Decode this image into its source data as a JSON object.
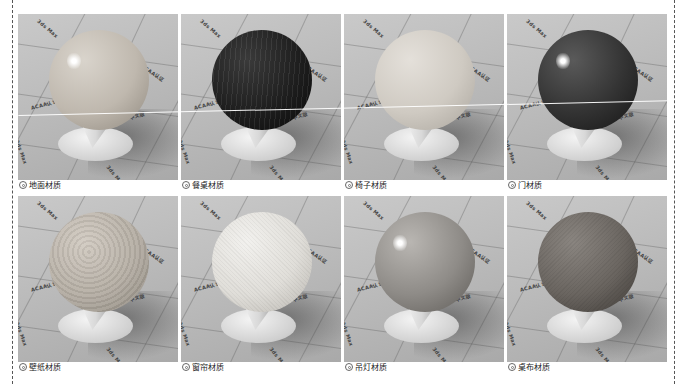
{
  "page": {
    "layout": "2 rows x 4 columns material preview grid",
    "rows": [
      {
        "items": [
          {
            "label": "地面材质",
            "bullet_icon": "circled-dot-icon",
            "sphere": {
              "base": "#d9d4cc",
              "mid": "#bfb8ae",
              "dark": "#8f887e",
              "texture": "marble",
              "highlight": true
            }
          },
          {
            "label": "餐桌材质",
            "bullet_icon": "circled-dot-icon",
            "sphere": {
              "base": "#3a3a3a",
              "mid": "#1e1e1e",
              "dark": "#0a0a0a",
              "texture": "dark-wood-stripes",
              "highlight": false
            }
          },
          {
            "label": "椅子材质",
            "bullet_icon": "circled-dot-icon",
            "sphere": {
              "base": "#e4e0da",
              "mid": "#cfcac2",
              "dark": "#a9a49c",
              "texture": "matte",
              "highlight": false
            }
          },
          {
            "label": "门材质",
            "bullet_icon": "circled-dot-icon",
            "sphere": {
              "base": "#5a5a5a",
              "mid": "#333333",
              "dark": "#151515",
              "texture": "glossy-dark",
              "highlight": true
            }
          }
        ]
      },
      {
        "items": [
          {
            "label": "壁纸材质",
            "bullet_icon": "circled-dot-icon",
            "sphere": {
              "base": "#d2cbc2",
              "mid": "#b5aea4",
              "dark": "#8d877e",
              "texture": "damask-pattern",
              "highlight": false
            }
          },
          {
            "label": "窗帘材质",
            "bullet_icon": "circled-dot-icon",
            "sphere": {
              "base": "#f2f1ee",
              "mid": "#e0ded9",
              "dark": "#b9b6b0",
              "texture": "woven",
              "highlight": false
            }
          },
          {
            "label": "吊灯材质",
            "bullet_icon": "circled-dot-icon",
            "sphere": {
              "base": "#b9b6b2",
              "mid": "#8e8b87",
              "dark": "#5e5b57",
              "texture": "glossy-metal",
              "highlight": true
            }
          },
          {
            "label": "桌布材质",
            "bullet_icon": "circled-dot-icon",
            "sphere": {
              "base": "#8a8580",
              "mid": "#6a6560",
              "dark": "#3e3a36",
              "texture": "fabric",
              "highlight": false
            }
          }
        ]
      }
    ],
    "floor_watermarks": [
      "3ds Max",
      "ACAA认证",
      "中文版",
      "3ds Max"
    ]
  }
}
